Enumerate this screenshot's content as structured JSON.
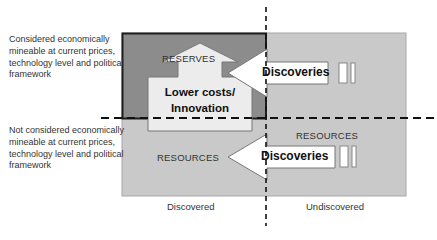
{
  "diagram": {
    "row_labels": {
      "top": "Considered economically mineable at current prices, technology level and political framework",
      "bottom": "Not considered economically mineable at current prices, technology level and political framework"
    },
    "column_labels": {
      "left": "Discovered",
      "right": "Undiscovered"
    },
    "regions": {
      "reserves": "RESERVES",
      "resources_undiscovered": "RESOURCES",
      "resources_discovered": "RESOURCES"
    },
    "arrows": {
      "up_arrow": "Lower costs/ Innovation",
      "up_arrow_line1": "Lower costs/",
      "up_arrow_line2": "Innovation",
      "left_arrow_top": "Discoveries",
      "left_arrow_bottom": "Discoveries"
    },
    "colors": {
      "reserves_fill": "#8a8a8a",
      "resources_fill": "#c8c8c8",
      "arrow_fill": "#ffffff",
      "up_arrow_fill": "#ececec",
      "border": "#222222",
      "dashed_line": "#111111"
    }
  }
}
